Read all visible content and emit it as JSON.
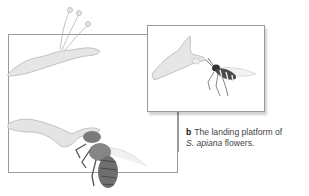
{
  "figure": {
    "panel_label": "b",
    "caption_text": "The landing platform of",
    "species": "S. apiana",
    "caption_tail": "flowers.",
    "illustrations": [
      {
        "name": "sage-flower-with-stamens",
        "description": "Salvia apiana flower with extended stamens"
      },
      {
        "name": "wasp-approaching-flower",
        "description": "Wasp approaching flower landing platform (inset)"
      },
      {
        "name": "bee-on-flower",
        "description": "Carpenter bee landing on lower lip of flower"
      }
    ]
  }
}
